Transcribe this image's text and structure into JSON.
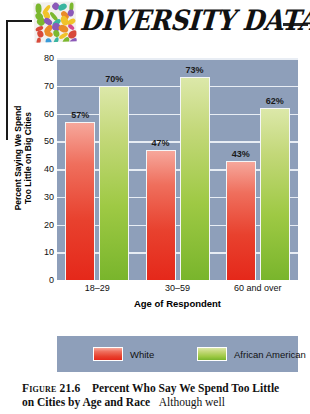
{
  "header": {
    "title": "DIVERSITY DATA",
    "logo_name": "mosaic-tiles-logo"
  },
  "chart_data": {
    "type": "bar",
    "title": "Percent Who Say We Spend Too Little on Cities by Age and Race",
    "xlabel": "Age of Respondent",
    "ylabel": "Percent Saying We Spend Too Little on Big Cities",
    "ylabel_line1": "Percent Saying We Spend",
    "ylabel_line2": "Too Little on Big Cities",
    "categories": [
      "18–29",
      "30–59",
      "60 and over"
    ],
    "series": [
      {
        "name": "White",
        "color": "#e8412e",
        "values": [
          57,
          47,
          43
        ],
        "labels": [
          "57%",
          "47%",
          "43%"
        ]
      },
      {
        "name": "African American",
        "color": "#9ec944",
        "values": [
          70,
          73,
          62
        ],
        "labels": [
          "70%",
          "73%",
          "62%"
        ]
      }
    ],
    "ylim": [
      0,
      80
    ],
    "yticks": [
      0,
      10,
      20,
      30,
      40,
      50,
      60,
      70,
      80
    ],
    "ytick_labels": [
      "0",
      "10",
      "20",
      "30",
      "40",
      "50",
      "60",
      "70",
      "80"
    ],
    "grid": true,
    "legend_position": "bottom",
    "plot_background": "#8e9fba",
    "gridline_color": "#e8edf4"
  },
  "caption": {
    "figure_number": "Figure 21.6",
    "bold_text": "Percent Who Say We Spend Too Little on Cities by Age and Race",
    "description": "Although well"
  }
}
